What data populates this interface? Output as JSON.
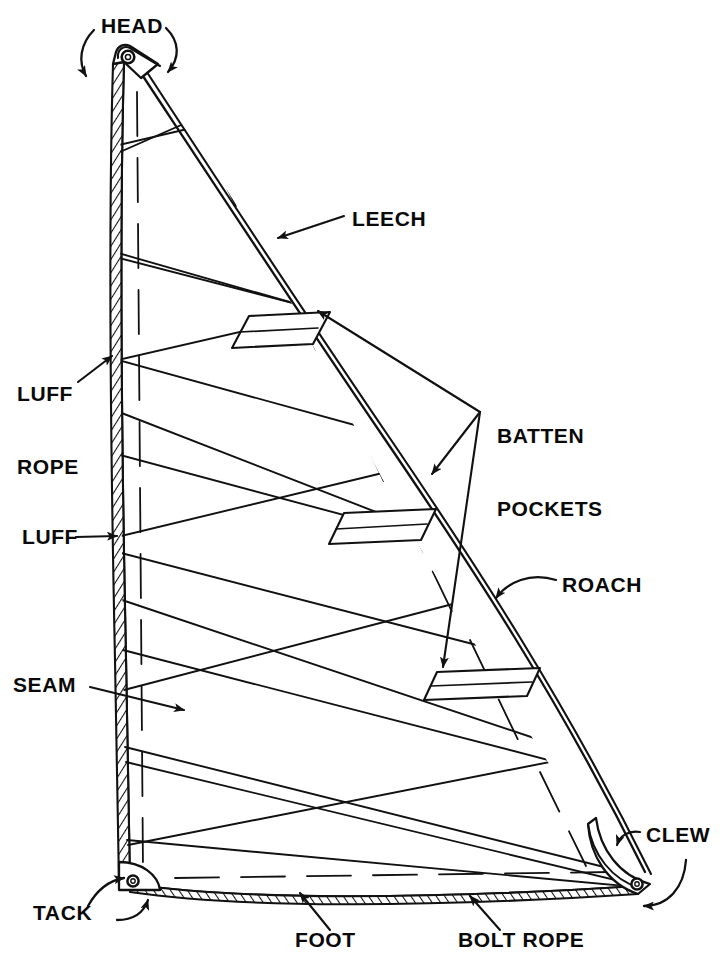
{
  "diagram": {
    "type": "technical-line-drawing",
    "line_color": "#111111",
    "background_color": "#ffffff"
  },
  "labels": {
    "head": "HEAD",
    "leech": "LEECH",
    "luff_rope": "LUFF\nROPE",
    "luff_rope_line1": "LUFF",
    "luff_rope_line2": "ROPE",
    "batten_pockets": "BATTEN\nPOCKETS",
    "batten_pockets_line1": "BATTEN",
    "batten_pockets_line2": "POCKETS",
    "luff": "LUFF",
    "roach": "ROACH",
    "seam": "SEAM",
    "clew": "CLEW",
    "tack": "TACK",
    "foot": "FOOT",
    "bolt_rope": "BOLT ROPE"
  },
  "parts": [
    {
      "name": "head",
      "label": "HEAD",
      "description": "top corner of the sail with grommet, reinforced triangular patch",
      "pointer": "two curved arrows"
    },
    {
      "name": "leech",
      "label": "LEECH",
      "description": "trailing aft edge of the sail",
      "pointer": "straight leader with arrow"
    },
    {
      "name": "luff-rope",
      "label": "LUFF ROPE",
      "description": "rope sewn into the leading edge",
      "pointer": "straight leader with arrow"
    },
    {
      "name": "luff",
      "label": "LUFF",
      "description": "leading forward edge of the sail",
      "pointer": "straight leader with arrow"
    },
    {
      "name": "seam",
      "label": "SEAM",
      "description": "stitched joint between sail panels",
      "pointer": "straight leader with arrow"
    },
    {
      "name": "batten-pockets",
      "label": "BATTEN POCKETS",
      "description": "three sleeve pockets holding battens along the leech",
      "pointer": "three leaders from a common vertex"
    },
    {
      "name": "roach",
      "label": "ROACH",
      "description": "convex curved area of the leech outside the straight line from head to clew",
      "pointer": "curved leader with arrow"
    },
    {
      "name": "clew",
      "label": "CLEW",
      "description": "aft lower corner with grommet",
      "pointer": "two curved arrows"
    },
    {
      "name": "tack",
      "label": "TACK",
      "description": "forward lower corner with grommet",
      "pointer": "two curved arrows"
    },
    {
      "name": "foot",
      "label": "FOOT",
      "description": "bottom edge of the sail",
      "pointer": "straight leader with arrow"
    },
    {
      "name": "bolt-rope",
      "label": "BOLT ROPE",
      "description": "rope sewn into the foot edge",
      "pointer": "straight leader with arrow"
    }
  ],
  "counts": {
    "batten_pockets": 3,
    "grommets": 3,
    "seams": 7
  }
}
